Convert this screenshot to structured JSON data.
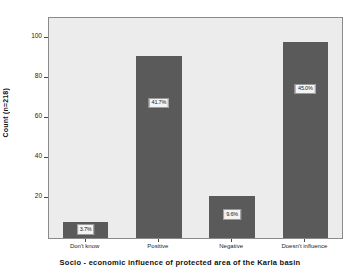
{
  "chart_data": {
    "type": "bar",
    "title": "",
    "xlabel": "Socio - economic influence of protected area of the Karla basin",
    "ylabel": "Count (n=218)",
    "categories": [
      "Don't know",
      "Positive",
      "Negative",
      "Doesn't influence"
    ],
    "values": [
      8,
      91,
      21,
      98
    ],
    "data_labels": [
      "3.7%",
      "41.7%",
      "9.6%",
      "45.0%"
    ],
    "ylim": [
      0,
      110
    ],
    "yticks": [
      20,
      40,
      60,
      80,
      100
    ],
    "ytick_labels": [
      "20",
      "40",
      "60",
      "80",
      "100"
    ],
    "grid": false,
    "legend": false,
    "total_n": 218,
    "bar_color": "#5a5a5a",
    "plot_background": "#ececec",
    "figure_background": "#ffffff"
  }
}
